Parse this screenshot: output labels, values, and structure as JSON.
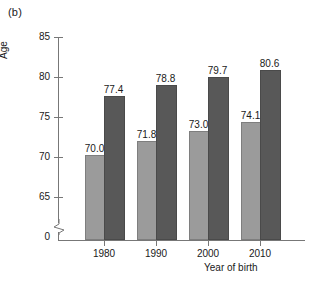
{
  "figure": {
    "panel_label": "(b)"
  },
  "chart_data": {
    "type": "bar",
    "title": "",
    "xlabel": "Year of birth",
    "ylabel": "Age",
    "categories": [
      "1980",
      "1990",
      "2000",
      "2010"
    ],
    "series": [
      {
        "name": "light-gray-series",
        "values": [
          70.0,
          71.8,
          73.0,
          74.1
        ],
        "color": "#9b9b9b"
      },
      {
        "name": "dark-gray-series",
        "values": [
          77.4,
          78.8,
          79.7,
          80.6
        ],
        "color": "#585858"
      }
    ],
    "value_labels": [
      [
        "70.0",
        "71.8",
        "73.0",
        "74.1"
      ],
      [
        "77.4",
        "78.8",
        "79.7",
        "80.6"
      ]
    ],
    "ylim": [
      65,
      85
    ],
    "yticks": [
      "0",
      "65",
      "70",
      "75",
      "80",
      "85"
    ],
    "axis_break": true,
    "grid": false,
    "legend": "none"
  }
}
